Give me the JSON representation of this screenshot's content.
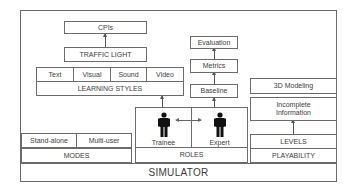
{
  "diagram": {
    "base": {
      "label": "SIMULATOR"
    },
    "modes": {
      "label": "MODES",
      "items": [
        "Stand-alone",
        "Multi-user"
      ]
    },
    "learning": {
      "label": "LEARNING STYLES",
      "items": [
        "Text",
        "Visual",
        "Sound",
        "Video"
      ],
      "traffic_light": "TRAFFIC LIGHT",
      "cpis": "CPIs"
    },
    "roles": {
      "label": "ROLES",
      "items": [
        {
          "label": "Trainee",
          "icon": "person-icon"
        },
        {
          "label": "Expert",
          "icon": "person-icon"
        }
      ],
      "baseline": "Baseline",
      "metrics": "Metrics",
      "evaluation": "Evaluation"
    },
    "playability": {
      "label": "PLAYABILITY",
      "levels": "LEVELS",
      "incomplete_information": "Incomplete Information",
      "modeling": "3D Modeling"
    },
    "colors": {
      "border": "#6b6b6b",
      "text": "#3c3c3c",
      "figure": "#111111"
    }
  }
}
